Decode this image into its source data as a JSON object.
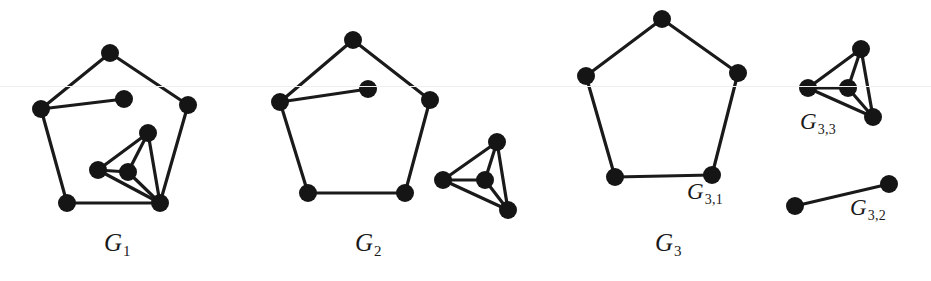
{
  "figure": {
    "background_color": "#ffffff",
    "ink_color": "#1a1a1a",
    "node_fill": "#151515",
    "width": 931,
    "height": 281,
    "scanline_y": 86,
    "scanline_color": "#f0eff0"
  },
  "labels": {
    "g1": {
      "base": "G",
      "sub": "1",
      "x": 104,
      "y": 230
    },
    "g2": {
      "base": "G",
      "sub": "2",
      "x": 355,
      "y": 230
    },
    "g3": {
      "base": "G",
      "sub": "3",
      "x": 655,
      "y": 230
    },
    "g31": {
      "base": "G",
      "sub": "3,1",
      "x": 687,
      "y": 180
    },
    "g32": {
      "base": "G",
      "sub": "3,2",
      "x": 850,
      "y": 196
    },
    "g33": {
      "base": "G",
      "sub": "3,3",
      "x": 800,
      "y": 110
    }
  },
  "graphs": [
    {
      "id": "G1",
      "name": "graph-g1",
      "label_key": "g1",
      "node_radius": 9,
      "edge_width": 3.2,
      "nodes": [
        {
          "id": "a",
          "x": 110,
          "y": 53
        },
        {
          "id": "b",
          "x": 188,
          "y": 105
        },
        {
          "id": "c",
          "x": 160,
          "y": 203
        },
        {
          "id": "d",
          "x": 67,
          "y": 203
        },
        {
          "id": "e",
          "x": 41,
          "y": 109
        },
        {
          "id": "p",
          "x": 124,
          "y": 99
        },
        {
          "id": "k1",
          "x": 148,
          "y": 133
        },
        {
          "id": "k2",
          "x": 98,
          "y": 170
        },
        {
          "id": "k3",
          "x": 128,
          "y": 172
        }
      ],
      "edges": [
        [
          "a",
          "b"
        ],
        [
          "b",
          "c"
        ],
        [
          "c",
          "d"
        ],
        [
          "d",
          "e"
        ],
        [
          "e",
          "a"
        ],
        [
          "e",
          "p"
        ],
        [
          "k1",
          "k2"
        ],
        [
          "k1",
          "k3"
        ],
        [
          "k1",
          "c"
        ],
        [
          "k2",
          "k3"
        ],
        [
          "k2",
          "c"
        ],
        [
          "k3",
          "c"
        ]
      ]
    },
    {
      "id": "G2",
      "name": "graph-g2",
      "label_key": "g2",
      "node_radius": 9,
      "edge_width": 3.2,
      "nodes": [
        {
          "id": "a",
          "x": 353,
          "y": 40
        },
        {
          "id": "b",
          "x": 430,
          "y": 100
        },
        {
          "id": "c",
          "x": 405,
          "y": 193
        },
        {
          "id": "d",
          "x": 308,
          "y": 193
        },
        {
          "id": "e",
          "x": 280,
          "y": 102
        },
        {
          "id": "p",
          "x": 368,
          "y": 89
        },
        {
          "id": "k1",
          "x": 497,
          "y": 142
        },
        {
          "id": "k2",
          "x": 443,
          "y": 180
        },
        {
          "id": "k3",
          "x": 485,
          "y": 180
        },
        {
          "id": "k4",
          "x": 508,
          "y": 210
        }
      ],
      "edges": [
        [
          "a",
          "b"
        ],
        [
          "b",
          "c"
        ],
        [
          "c",
          "d"
        ],
        [
          "d",
          "e"
        ],
        [
          "e",
          "a"
        ],
        [
          "e",
          "p"
        ],
        [
          "k1",
          "k2"
        ],
        [
          "k1",
          "k3"
        ],
        [
          "k1",
          "k4"
        ],
        [
          "k2",
          "k3"
        ],
        [
          "k2",
          "k4"
        ],
        [
          "k3",
          "k4"
        ]
      ]
    },
    {
      "id": "G3",
      "name": "graph-g3",
      "label_key": "g3",
      "node_radius": 9,
      "edge_width": 3.2,
      "nodes": [
        {
          "id": "a",
          "x": 662,
          "y": 19
        },
        {
          "id": "b",
          "x": 738,
          "y": 73
        },
        {
          "id": "c",
          "x": 712,
          "y": 175
        },
        {
          "id": "d",
          "x": 615,
          "y": 177
        },
        {
          "id": "e",
          "x": 586,
          "y": 76
        }
      ],
      "edges": [
        [
          "a",
          "b"
        ],
        [
          "b",
          "c"
        ],
        [
          "c",
          "d"
        ],
        [
          "d",
          "e"
        ],
        [
          "e",
          "a"
        ]
      ]
    },
    {
      "id": "G3,3",
      "name": "graph-g33",
      "label_key": "g33",
      "node_radius": 9,
      "edge_width": 3.2,
      "nodes": [
        {
          "id": "k1",
          "x": 861,
          "y": 49
        },
        {
          "id": "k2",
          "x": 808,
          "y": 88
        },
        {
          "id": "k3",
          "x": 848,
          "y": 88
        },
        {
          "id": "k4",
          "x": 873,
          "y": 117
        }
      ],
      "edges": [
        [
          "k1",
          "k2"
        ],
        [
          "k1",
          "k3"
        ],
        [
          "k1",
          "k4"
        ],
        [
          "k2",
          "k3"
        ],
        [
          "k2",
          "k4"
        ],
        [
          "k3",
          "k4"
        ]
      ]
    },
    {
      "id": "G3,2",
      "name": "graph-g32",
      "label_key": "g32",
      "node_radius": 9,
      "edge_width": 3.2,
      "nodes": [
        {
          "id": "u",
          "x": 795,
          "y": 206
        },
        {
          "id": "v",
          "x": 889,
          "y": 184
        }
      ],
      "edges": [
        [
          "u",
          "v"
        ]
      ]
    }
  ]
}
